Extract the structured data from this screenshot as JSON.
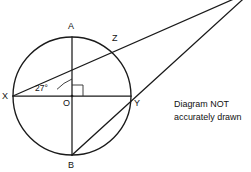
{
  "diagram": {
    "type": "circle-geometry",
    "circle": {
      "center_label": "O",
      "center_x": 72,
      "center_y": 96,
      "radius": 59
    },
    "points": [
      {
        "id": "A",
        "label": "A",
        "x": 72,
        "y": 37,
        "label_x": 68,
        "label_y": 22
      },
      {
        "id": "Z",
        "label": "Z",
        "x": 115,
        "y": 50,
        "label_x": 112,
        "label_y": 34
      },
      {
        "id": "X",
        "label": "X",
        "x": 13,
        "y": 96,
        "label_x": 2,
        "label_y": 92
      },
      {
        "id": "Y",
        "label": "Y",
        "x": 131,
        "y": 96,
        "label_x": 134,
        "label_y": 99
      },
      {
        "id": "B",
        "label": "B",
        "x": 72,
        "y": 155,
        "label_x": 68,
        "label_y": 161
      },
      {
        "id": "O",
        "label": "O",
        "x": 72,
        "y": 96,
        "label_x": 63,
        "label_y": 99
      }
    ],
    "angle": {
      "label": "27°",
      "value": 27,
      "unit": "degrees",
      "vertex": "X",
      "between": [
        "XY",
        "XZ"
      ],
      "label_x": 35,
      "label_y": 84
    },
    "right_angle": {
      "label": "right-angle",
      "vertex": "O",
      "quadrant": "upper-right",
      "size": 11
    },
    "segments": [
      {
        "name": "diameter-XY",
        "from": "X",
        "to": "Y"
      },
      {
        "name": "diameter-AB",
        "from": "A",
        "to": "B"
      },
      {
        "name": "line-X-Z-apex",
        "from": "X",
        "to": "apex"
      },
      {
        "name": "line-B-Y-apex",
        "from": "B",
        "to": "apex"
      }
    ],
    "apex": {
      "x": 252,
      "y": -9
    },
    "note": {
      "line1": "Diagram NOT",
      "line2": "accurately drawn"
    },
    "colors": {
      "stroke": "#1a1a1a",
      "mark": "#2b2b2b",
      "text": "#111111",
      "background": "#ffffff"
    }
  }
}
